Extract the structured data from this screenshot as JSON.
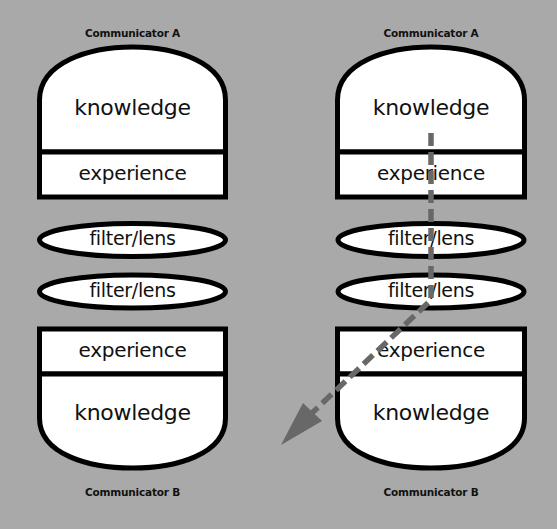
{
  "colors": {
    "background": "#a9a9a9",
    "shape_fill": "#ffffff",
    "stroke": "#000000",
    "arrow": "#686868"
  },
  "left_column": {
    "top_label": "Communicator A",
    "top_knowledge": "knowledge",
    "top_experience": "experience",
    "lens_1": "filter/lens",
    "lens_2": "filter/lens",
    "bottom_experience": "experience",
    "bottom_knowledge": "knowledge",
    "bottom_label": "Communicator B"
  },
  "right_column": {
    "top_label": "Communicator A",
    "top_knowledge": "knowledge",
    "top_experience": "experience",
    "lens_1": "filter/lens",
    "lens_2": "filter/lens",
    "bottom_experience": "experience",
    "bottom_knowledge": "knowledge",
    "bottom_label": "Communicator B",
    "arrow": "dashed-arrow"
  }
}
